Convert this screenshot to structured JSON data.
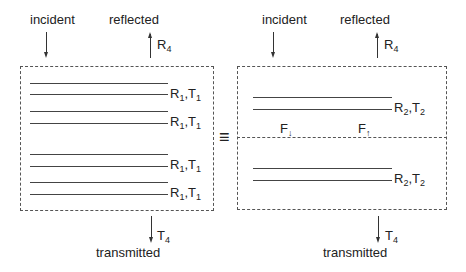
{
  "left_panel": {
    "incident_label": "incident",
    "reflected_label": "reflected",
    "transmitted_label": "transmitted",
    "reflect_symbol": "R",
    "reflect_sub": "4",
    "transmit_symbol": "T",
    "transmit_sub": "4",
    "layers": [
      {
        "r": "R",
        "r_sub": "1",
        "t": "T",
        "t_sub": "1"
      },
      {
        "r": "R",
        "r_sub": "1",
        "t": "T",
        "t_sub": "1"
      },
      {
        "r": "R",
        "r_sub": "1",
        "t": "T",
        "t_sub": "1"
      },
      {
        "r": "R",
        "r_sub": "1",
        "t": "T",
        "t_sub": "1"
      }
    ]
  },
  "equivalence_symbol": "≡",
  "right_panel": {
    "incident_label": "incident",
    "reflected_label": "reflected",
    "transmitted_label": "transmitted",
    "reflect_symbol": "R",
    "reflect_sub": "4",
    "transmit_symbol": "T",
    "transmit_sub": "4",
    "layers": [
      {
        "r": "R",
        "r_sub": "2",
        "t": "T",
        "t_sub": "2"
      },
      {
        "r": "R",
        "r_sub": "2",
        "t": "T",
        "t_sub": "2"
      }
    ],
    "flux_down": "F",
    "flux_up": "F",
    "flux_down_arrow": "↓",
    "flux_up_arrow": "↑"
  }
}
